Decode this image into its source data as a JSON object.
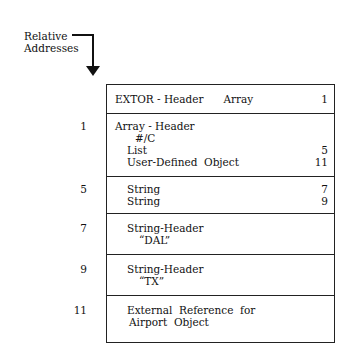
{
  "legend": {
    "label_line1": "Relative",
    "label_line2": "Addresses"
  },
  "rows": [
    {
      "addr": "",
      "lines": [
        {
          "text": "EXTOR - Header      Array",
          "num": "1",
          "indent": 8
        }
      ]
    },
    {
      "addr": "1",
      "lines": [
        {
          "text": "Array - Header",
          "num": "",
          "indent": 8
        },
        {
          "text": "#/C",
          "num": "",
          "indent": 28
        },
        {
          "text": "List",
          "num": "5",
          "indent": 20
        },
        {
          "text": "User-Defined  Object",
          "num": "11",
          "indent": 20
        }
      ]
    },
    {
      "addr": "5",
      "lines": [
        {
          "text": "String",
          "num": "7",
          "indent": 20
        },
        {
          "text": "String",
          "num": "9",
          "indent": 20
        }
      ]
    },
    {
      "addr": "7",
      "lines": [
        {
          "text": "String-Header",
          "num": "",
          "indent": 20
        },
        {
          "text": "“DAL”",
          "num": "",
          "indent": 32
        }
      ]
    },
    {
      "addr": "9",
      "lines": [
        {
          "text": "String-Header",
          "num": "",
          "indent": 20
        },
        {
          "text": "“TX”",
          "num": "",
          "indent": 32
        }
      ]
    },
    {
      "addr": "11",
      "lines": [
        {
          "text": "External  Reference  for",
          "num": "",
          "indent": 20
        },
        {
          "text": "Airport  Object",
          "num": "",
          "indent": 22
        }
      ]
    }
  ]
}
